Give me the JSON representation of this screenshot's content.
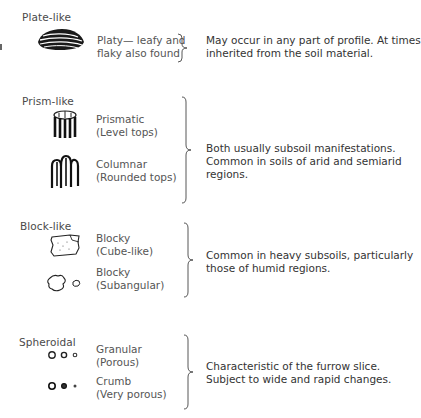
{
  "groups": [
    {
      "category": "Plate-like",
      "items": [
        {
          "icon": "platy-structure-icon",
          "line1": "Platy— leafy and",
          "line2": "flaky also found"
        }
      ],
      "description": [
        "May occur in any part of profile.  At times",
        "inherited from the soil material."
      ]
    },
    {
      "category": "Prism-like",
      "items": [
        {
          "icon": "prismatic-structure-icon",
          "line1": "Prismatic",
          "line2": "(Level tops)"
        },
        {
          "icon": "columnar-structure-icon",
          "line1": "Columnar",
          "line2": "(Rounded tops)"
        }
      ],
      "description": [
        "Both usually subsoil manifestations.",
        "Common in soils of arid and semiarid",
        "regions."
      ]
    },
    {
      "category": "Block-like",
      "items": [
        {
          "icon": "blocky-cube-structure-icon",
          "line1": "Blocky",
          "line2": "(Cube-like)"
        },
        {
          "icon": "blocky-subangular-structure-icon",
          "line1": "Blocky",
          "line2": "(Subangular)"
        }
      ],
      "description": [
        "Common in heavy subsoils, particularly",
        "those of humid regions."
      ]
    },
    {
      "category": "Spheroidal",
      "items": [
        {
          "icon": "granular-structure-icon",
          "line1": "Granular",
          "line2": "(Porous)"
        },
        {
          "icon": "crumb-structure-icon",
          "line1": "Crumb",
          "line2": "(Very porous)"
        }
      ],
      "description": [
        "Characteristic of the furrow slice.",
        "Subject to wide and rapid changes."
      ]
    }
  ]
}
